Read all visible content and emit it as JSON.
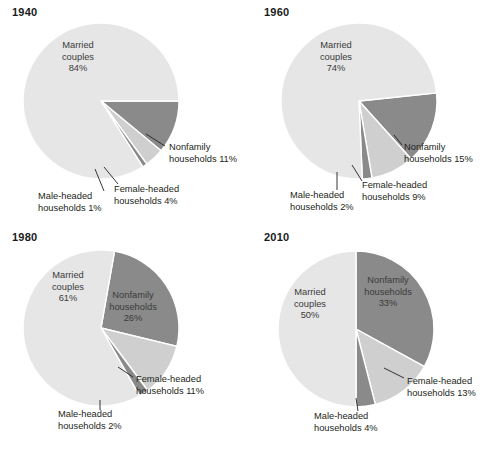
{
  "figure": {
    "title": "",
    "background": "#ffffff"
  },
  "colors": {
    "married": "#e6e6e6",
    "nonfamily": "#8a8a8a",
    "female_headed": "#cfcfcf",
    "male_headed": "#8a8a8a",
    "text": "#231f20",
    "slice_border": "#ffffff"
  },
  "chart_data": [
    {
      "type": "pie",
      "title": "1940",
      "categories": [
        "Married couples",
        "Nonfamily households",
        "Female-headed households",
        "Male-headed households"
      ],
      "values": [
        84,
        11,
        4,
        1
      ],
      "labels": [
        {
          "name": "married",
          "line1": "Married",
          "line2": "couples",
          "line3": "84%",
          "inside": true
        },
        {
          "name": "nonfamily",
          "line1": "Nonfamily",
          "line2": "households 11%",
          "inside": false
        },
        {
          "name": "female-headed",
          "line1": "Female-headed",
          "line2": "households 4%",
          "inside": false
        },
        {
          "name": "male-headed",
          "line1": "Male-headed",
          "line2": "households 1%",
          "inside": false
        }
      ]
    },
    {
      "type": "pie",
      "title": "1960",
      "categories": [
        "Married couples",
        "Nonfamily households",
        "Female-headed households",
        "Male-headed households"
      ],
      "values": [
        74,
        15,
        9,
        2
      ],
      "labels": [
        {
          "name": "married",
          "line1": "Married",
          "line2": "couples",
          "line3": "74%",
          "inside": true
        },
        {
          "name": "nonfamily",
          "line1": "Nonfamily",
          "line2": "households 15%",
          "inside": false
        },
        {
          "name": "female-headed",
          "line1": "Female-headed",
          "line2": "households 9%",
          "inside": false
        },
        {
          "name": "male-headed",
          "line1": "Male-headed",
          "line2": "households 2%",
          "inside": false
        }
      ]
    },
    {
      "type": "pie",
      "title": "1980",
      "categories": [
        "Married couples",
        "Nonfamily households",
        "Female-headed households",
        "Male-headed households"
      ],
      "values": [
        61,
        26,
        11,
        2
      ],
      "labels": [
        {
          "name": "married",
          "line1": "Married",
          "line2": "couples",
          "line3": "61%",
          "inside": true
        },
        {
          "name": "nonfamily",
          "line1": "Nonfamily",
          "line2": "households",
          "line3": "26%",
          "inside": true
        },
        {
          "name": "female-headed",
          "line1": "Female-headed",
          "line2": "households 11%",
          "inside": false
        },
        {
          "name": "male-headed",
          "line1": "Male-headed",
          "line2": "households 2%",
          "inside": false
        }
      ]
    },
    {
      "type": "pie",
      "title": "2010",
      "categories": [
        "Married couples",
        "Nonfamily households",
        "Female-headed households",
        "Male-headed households"
      ],
      "values": [
        50,
        33,
        13,
        4
      ],
      "labels": [
        {
          "name": "married",
          "line1": "Married",
          "line2": "couples",
          "line3": "50%",
          "inside": true
        },
        {
          "name": "nonfamily",
          "line1": "Nonfamily",
          "line2": "households",
          "line3": "33%",
          "inside": true
        },
        {
          "name": "female-headed",
          "line1": "Female-headed",
          "line2": "households 13%",
          "inside": false
        },
        {
          "name": "male-headed",
          "line1": "Male-headed",
          "line2": "households 4%",
          "inside": false
        }
      ]
    }
  ],
  "geometry": [
    {
      "cx": 101,
      "cy": 101,
      "r": 78,
      "start_angle": 0,
      "order": [
        "nonfamily",
        "female_headed",
        "male_headed",
        "married"
      ],
      "label_pos": {
        "married": {
          "x": 78,
          "y": 48,
          "anchor": "middle"
        },
        "nonfamily": {
          "x": 169,
          "y": 150,
          "anchor": "start"
        },
        "female_headed": {
          "x": 114,
          "y": 192,
          "anchor": "start"
        },
        "male_headed": {
          "x": 38,
          "y": 199,
          "anchor": "start"
        }
      },
      "leaders": [
        {
          "name": "nonfamily-leader",
          "x1": 146,
          "y1": 134,
          "x2": 165,
          "y2": 146
        },
        {
          "name": "female-headed-leader",
          "x1": 104,
          "y1": 167,
          "x2": 118,
          "y2": 184
        },
        {
          "name": "male-headed-leader",
          "x1": 95,
          "y1": 169,
          "x2": 104,
          "y2": 191
        }
      ]
    },
    {
      "cx": 107,
      "cy": 101,
      "r": 78,
      "start_angle": -6,
      "order": [
        "nonfamily",
        "female_headed",
        "male_headed",
        "married"
      ],
      "label_pos": {
        "married": {
          "x": 84,
          "y": 48,
          "anchor": "middle"
        },
        "nonfamily": {
          "x": 152,
          "y": 150,
          "anchor": "start"
        },
        "female_headed": {
          "x": 110,
          "y": 188,
          "anchor": "start"
        },
        "male_headed": {
          "x": 38,
          "y": 198,
          "anchor": "start"
        }
      },
      "leaders": [
        {
          "name": "nonfamily-leader",
          "x1": 142,
          "y1": 135,
          "x2": 150,
          "y2": 145
        },
        {
          "name": "female-headed-leader",
          "x1": 100,
          "y1": 165,
          "x2": 110,
          "y2": 181
        },
        {
          "name": "male-headed-leader",
          "x1": 85,
          "y1": 172,
          "x2": 85,
          "y2": 190
        }
      ]
    },
    {
      "cx": 101,
      "cy": 103,
      "r": 78,
      "start_angle": -80,
      "order": [
        "nonfamily",
        "female_headed",
        "male_headed",
        "married"
      ],
      "label_pos": {
        "married": {
          "x": 68,
          "y": 53,
          "anchor": "middle"
        },
        "nonfamily": {
          "x": 133,
          "y": 73,
          "anchor": "middle"
        },
        "female_headed": {
          "x": 136,
          "y": 157,
          "anchor": "start"
        },
        "male_headed": {
          "x": 58,
          "y": 192,
          "anchor": "start"
        }
      },
      "leaders": [
        {
          "name": "female-headed-leader",
          "x1": 118,
          "y1": 142,
          "x2": 133,
          "y2": 152
        },
        {
          "name": "male-headed-leader",
          "x1": 100,
          "y1": 175,
          "x2": 100,
          "y2": 185
        }
      ]
    },
    {
      "cx": 104,
      "cy": 104,
      "r": 78,
      "start_angle": -90,
      "order": [
        "nonfamily",
        "female_headed",
        "male_headed",
        "married"
      ],
      "label_pos": {
        "married": {
          "x": 58,
          "y": 70,
          "anchor": "middle"
        },
        "nonfamily": {
          "x": 136,
          "y": 58,
          "anchor": "middle"
        },
        "female_headed": {
          "x": 155,
          "y": 159,
          "anchor": "start"
        },
        "male_headed": {
          "x": 62,
          "y": 194,
          "anchor": "start"
        }
      },
      "leaders": [
        {
          "name": "female-headed-leader",
          "x1": 132,
          "y1": 143,
          "x2": 152,
          "y2": 153
        },
        {
          "name": "male-headed-leader",
          "x1": 104,
          "y1": 173,
          "x2": 106,
          "y2": 186
        }
      ]
    }
  ]
}
